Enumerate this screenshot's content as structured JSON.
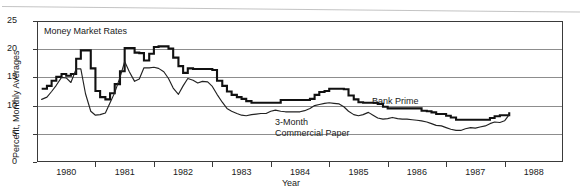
{
  "figure": {
    "note": "Money Market Rates",
    "axis_title_x": "Year",
    "axis_title_y": "Percent, Monthly Averages"
  },
  "labels": {
    "bank_prime": "Bank Prime",
    "commercial_paper_line1": "3-Month",
    "commercial_paper_line2": "Commercial Paper"
  },
  "ticks": {
    "y": [
      "0",
      "5",
      "10",
      "15",
      "20",
      "25"
    ],
    "x": [
      "1980",
      "1981",
      "1982",
      "1983",
      "1984",
      "1985",
      "1986",
      "1987",
      "1988"
    ]
  },
  "colors": {
    "prime_line": "#111111",
    "paper_line": "#222222",
    "gridline": "#8d8d8d",
    "frame": "#3a3a3a",
    "background": "#ffffff"
  },
  "chart_data": {
    "type": "line",
    "title": "Money Market Rates",
    "xlabel": "Year",
    "ylabel": "Percent, Monthly Averages",
    "xlim": [
      1979.5,
      1988.5
    ],
    "ylim": [
      0,
      25
    ],
    "yticks": [
      0,
      5,
      10,
      15,
      20,
      25
    ],
    "xticks": [
      1980,
      1981,
      1982,
      1983,
      1984,
      1985,
      1986,
      1987,
      1988
    ],
    "grid": "horizontal",
    "legend": "inline-annotations",
    "x": [
      1979.58,
      1979.67,
      1979.75,
      1979.83,
      1979.92,
      1980.0,
      1980.08,
      1980.17,
      1980.25,
      1980.33,
      1980.42,
      1980.5,
      1980.58,
      1980.67,
      1980.75,
      1980.83,
      1980.92,
      1981.0,
      1981.08,
      1981.17,
      1981.25,
      1981.33,
      1981.42,
      1981.5,
      1981.58,
      1981.67,
      1981.75,
      1981.83,
      1981.92,
      1982.0,
      1982.08,
      1982.17,
      1982.25,
      1982.33,
      1982.42,
      1982.5,
      1982.58,
      1982.67,
      1982.75,
      1982.83,
      1982.92,
      1983.0,
      1983.08,
      1983.17,
      1983.25,
      1983.33,
      1983.42,
      1983.5,
      1983.58,
      1983.67,
      1983.75,
      1983.83,
      1983.92,
      1984.0,
      1984.08,
      1984.17,
      1984.25,
      1984.33,
      1984.42,
      1984.5,
      1984.58,
      1984.67,
      1984.75,
      1984.83,
      1984.92,
      1985.0,
      1985.08,
      1985.17,
      1985.25,
      1985.33,
      1985.42,
      1985.5,
      1985.58,
      1985.67,
      1985.75,
      1985.83,
      1985.92,
      1986.0,
      1986.08,
      1986.17,
      1986.25,
      1986.33,
      1986.42,
      1986.5,
      1986.58,
      1986.67,
      1986.75,
      1986.83,
      1986.92,
      1987.0,
      1987.08,
      1987.17,
      1987.25,
      1987.33,
      1987.42,
      1987.5,
      1987.58
    ],
    "series": [
      {
        "name": "Bank Prime",
        "units": "percent",
        "values": [
          13.0,
          13.5,
          14.4,
          15.1,
          15.6,
          15.3,
          15.6,
          18.3,
          19.8,
          19.8,
          16.6,
          12.6,
          11.5,
          11.1,
          12.2,
          13.8,
          16.1,
          20.2,
          20.2,
          19.4,
          19.3,
          18.0,
          19.2,
          20.4,
          20.5,
          20.5,
          20.1,
          18.5,
          17.0,
          15.8,
          16.6,
          16.5,
          16.5,
          16.5,
          16.5,
          16.3,
          14.4,
          13.5,
          12.5,
          11.9,
          11.5,
          11.2,
          10.8,
          10.5,
          10.5,
          10.5,
          10.5,
          10.5,
          10.5,
          11.0,
          11.0,
          11.0,
          11.0,
          11.0,
          11.0,
          11.2,
          11.9,
          12.4,
          12.6,
          13.0,
          13.0,
          13.0,
          12.9,
          11.8,
          11.1,
          10.6,
          10.5,
          10.5,
          10.5,
          10.3,
          9.8,
          9.5,
          9.5,
          9.5,
          9.5,
          9.5,
          9.5,
          9.5,
          9.1,
          9.0,
          8.8,
          8.5,
          8.5,
          8.2,
          7.9,
          7.5,
          7.5,
          7.5,
          7.5,
          7.5,
          7.5,
          7.5,
          7.8,
          8.1,
          8.3,
          8.3,
          8.8
        ]
      },
      {
        "name": "3-Month Commercial Paper",
        "units": "percent",
        "values": [
          11.1,
          11.5,
          12.5,
          13.6,
          15.0,
          14.9,
          14.1,
          16.5,
          16.5,
          12.1,
          9.0,
          8.3,
          8.4,
          8.7,
          10.5,
          12.3,
          15.0,
          17.8,
          16.0,
          14.3,
          14.7,
          16.7,
          16.7,
          16.8,
          16.6,
          16.0,
          14.8,
          13.1,
          12.0,
          13.5,
          14.8,
          14.5,
          14.0,
          14.3,
          14.2,
          13.4,
          12.0,
          10.6,
          9.5,
          9.0,
          8.6,
          8.3,
          8.2,
          8.4,
          8.5,
          8.6,
          8.6,
          9.0,
          9.2,
          9.0,
          8.9,
          8.9,
          8.9,
          8.9,
          9.1,
          9.5,
          10.0,
          10.2,
          10.4,
          10.5,
          10.4,
          10.3,
          9.8,
          9.0,
          8.4,
          8.2,
          8.4,
          8.8,
          8.3,
          7.8,
          7.6,
          7.7,
          7.9,
          7.7,
          7.6,
          7.6,
          7.5,
          7.4,
          7.3,
          7.1,
          6.8,
          6.5,
          6.4,
          6.1,
          5.8,
          5.6,
          5.6,
          5.9,
          6.1,
          6.0,
          6.2,
          6.4,
          6.8,
          7.1,
          7.0,
          7.3,
          8.4
        ]
      }
    ]
  }
}
